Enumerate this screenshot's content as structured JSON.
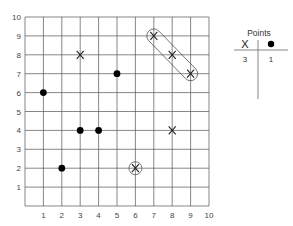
{
  "chart_data": {
    "type": "scatter",
    "title": "",
    "xlabel": "",
    "ylabel": "",
    "xlim": [
      0,
      10
    ],
    "ylim": [
      0,
      10
    ],
    "grid": true,
    "x_ticks": [
      "1",
      "2",
      "3",
      "4",
      "5",
      "6",
      "7",
      "8",
      "9",
      "10"
    ],
    "y_ticks": [
      "1",
      "2",
      "3",
      "4",
      "5",
      "6",
      "7",
      "8",
      "9",
      "10"
    ],
    "series": [
      {
        "name": "X",
        "marker": "x",
        "points": [
          [
            3,
            8
          ],
          [
            7,
            9
          ],
          [
            8,
            8
          ],
          [
            9,
            7
          ],
          [
            8,
            4
          ],
          [
            6,
            2
          ]
        ]
      },
      {
        "name": "dot",
        "marker": "filled-circle",
        "points": [
          [
            1,
            6
          ],
          [
            5,
            7
          ],
          [
            3,
            4
          ],
          [
            4,
            4
          ],
          [
            2,
            2
          ]
        ]
      }
    ],
    "annotations": [
      {
        "type": "capsule-enclosure",
        "points": [
          [
            7,
            9
          ],
          [
            8,
            8
          ],
          [
            9,
            7
          ]
        ]
      },
      {
        "type": "circle-enclosure",
        "points": [
          [
            6,
            2
          ]
        ]
      }
    ],
    "legend": {
      "title": "Points",
      "columns": [
        {
          "symbol": "X",
          "count": "3"
        },
        {
          "symbol": "●",
          "count": "1"
        }
      ]
    }
  }
}
